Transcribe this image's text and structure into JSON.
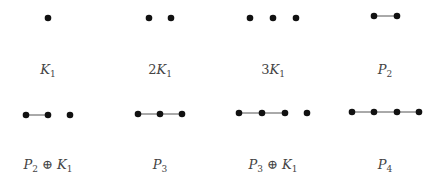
{
  "figure": {
    "graphs": [
      {
        "id": "K1",
        "label": {
          "parts": [
            {
              "type": "sym",
              "text": "K",
              "sub": "1"
            }
          ]
        },
        "vertices": 1,
        "edges": [],
        "text": "K1"
      },
      {
        "id": "2K1",
        "label": {
          "parts": [
            {
              "type": "coef",
              "text": "2"
            },
            {
              "type": "sym",
              "text": "K",
              "sub": "1"
            }
          ]
        },
        "vertices": 2,
        "edges": [],
        "text": "2K1"
      },
      {
        "id": "3K1",
        "label": {
          "parts": [
            {
              "type": "coef",
              "text": "3"
            },
            {
              "type": "sym",
              "text": "K",
              "sub": "1"
            }
          ]
        },
        "vertices": 3,
        "edges": [],
        "text": "3K1"
      },
      {
        "id": "P2",
        "label": {
          "parts": [
            {
              "type": "sym",
              "text": "P",
              "sub": "2"
            }
          ]
        },
        "vertices": 2,
        "edges": [
          [
            0,
            1
          ]
        ],
        "text": "P2"
      },
      {
        "id": "P2+K1",
        "label": {
          "parts": [
            {
              "type": "sym",
              "text": "P",
              "sub": "2"
            },
            {
              "type": "op",
              "text": "⊕"
            },
            {
              "type": "sym",
              "text": "K",
              "sub": "1"
            }
          ]
        },
        "vertices": 3,
        "edges": [
          [
            0,
            1
          ]
        ],
        "text": "P2 ⊕ K1"
      },
      {
        "id": "P3",
        "label": {
          "parts": [
            {
              "type": "sym",
              "text": "P",
              "sub": "3"
            }
          ]
        },
        "vertices": 3,
        "edges": [
          [
            0,
            1
          ],
          [
            1,
            2
          ]
        ],
        "text": "P3"
      },
      {
        "id": "P3+K1",
        "label": {
          "parts": [
            {
              "type": "sym",
              "text": "P",
              "sub": "3"
            },
            {
              "type": "op",
              "text": "⊕"
            },
            {
              "type": "sym",
              "text": "K",
              "sub": "1"
            }
          ]
        },
        "vertices": 4,
        "edges": [
          [
            0,
            1
          ],
          [
            1,
            2
          ]
        ],
        "text": "P3 ⊕ K1"
      },
      {
        "id": "P4",
        "label": {
          "parts": [
            {
              "type": "sym",
              "text": "P",
              "sub": "4"
            }
          ]
        },
        "vertices": 4,
        "edges": [
          [
            0,
            1
          ],
          [
            1,
            2
          ],
          [
            2,
            3
          ]
        ],
        "text": "P4"
      }
    ]
  }
}
